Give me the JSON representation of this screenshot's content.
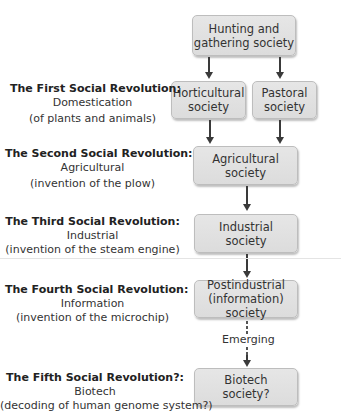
{
  "diagram": {
    "nodes": [
      {
        "id": "hunting",
        "label": "Hunting and\ngathering society"
      },
      {
        "id": "horticultural",
        "label": "Horticultural\nsociety"
      },
      {
        "id": "pastoral",
        "label": "Pastoral\nsociety"
      },
      {
        "id": "agricultural",
        "label": "Agricultural\nsociety"
      },
      {
        "id": "industrial",
        "label": "Industrial\nsociety"
      },
      {
        "id": "postindustrial",
        "label": "Postindustrial\n(information) society"
      },
      {
        "id": "biotech",
        "label": "Biotech\nsociety?"
      }
    ],
    "edges": [
      {
        "from": "hunting",
        "to": "horticultural",
        "style": "solid"
      },
      {
        "from": "hunting",
        "to": "pastoral",
        "style": "solid"
      },
      {
        "from": "horticultural",
        "to": "agricultural",
        "style": "solid"
      },
      {
        "from": "pastoral",
        "to": "agricultural",
        "style": "solid"
      },
      {
        "from": "agricultural",
        "to": "industrial",
        "style": "solid"
      },
      {
        "from": "industrial",
        "to": "postindustrial",
        "style": "solid"
      },
      {
        "from": "postindustrial",
        "to": "biotech",
        "style": "dotted",
        "label": "Emerging"
      }
    ],
    "revolutions": [
      {
        "title": "The First Social Revolution:",
        "name": "Domestication",
        "cause": "(of plants and animals)"
      },
      {
        "title": "The Second Social Revolution:",
        "name": "Agricultural",
        "cause": "(invention of the plow)"
      },
      {
        "title": "The Third Social Revolution:",
        "name": "Industrial",
        "cause": "(invention of the steam engine)"
      },
      {
        "title": "The Fourth Social Revolution:",
        "name": "Information",
        "cause": "(invention of the microchip)"
      },
      {
        "title": "The Fifth Social Revolution?:",
        "name": "Biotech",
        "cause": "(decoding of human genome system?)"
      }
    ],
    "emerging_label": "Emerging",
    "colors": {
      "box_fill": "#e0e0e0",
      "box_border": "#bdbdbd",
      "arrow": "#3a3a3a",
      "text": "#333333"
    }
  }
}
